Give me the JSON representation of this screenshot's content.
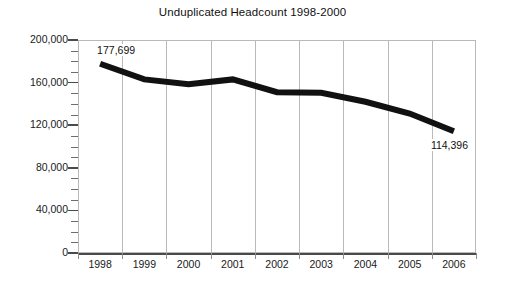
{
  "chart_data": {
    "type": "line",
    "title": "Unduplicated Headcount 1998-2000",
    "xlabel": "",
    "ylabel": "",
    "grid": "vertical",
    "legend": "none",
    "categories": [
      "1998",
      "1999",
      "2000",
      "2001",
      "2002",
      "2003",
      "2004",
      "2005",
      "2006"
    ],
    "series": [
      {
        "name": "Unduplicated Headcount",
        "color": "#111111",
        "values": [
          177699,
          163000,
          158500,
          163000,
          151000,
          150500,
          142000,
          131000,
          114396
        ]
      }
    ],
    "ylim": [
      0,
      200000
    ],
    "ytick_values": [
      0,
      40000,
      80000,
      120000,
      160000,
      200000
    ],
    "ytick_labels": [
      "0",
      "40,000",
      "80,000",
      "120,000",
      "160,000",
      "200,000"
    ],
    "yminor_step": 10000,
    "annotations": [
      {
        "name": "start-value-label",
        "text": "177,699",
        "category": "1998",
        "value": 177699
      },
      {
        "name": "end-value-label",
        "text": "114,396",
        "category": "2006",
        "value": 114396
      }
    ]
  }
}
